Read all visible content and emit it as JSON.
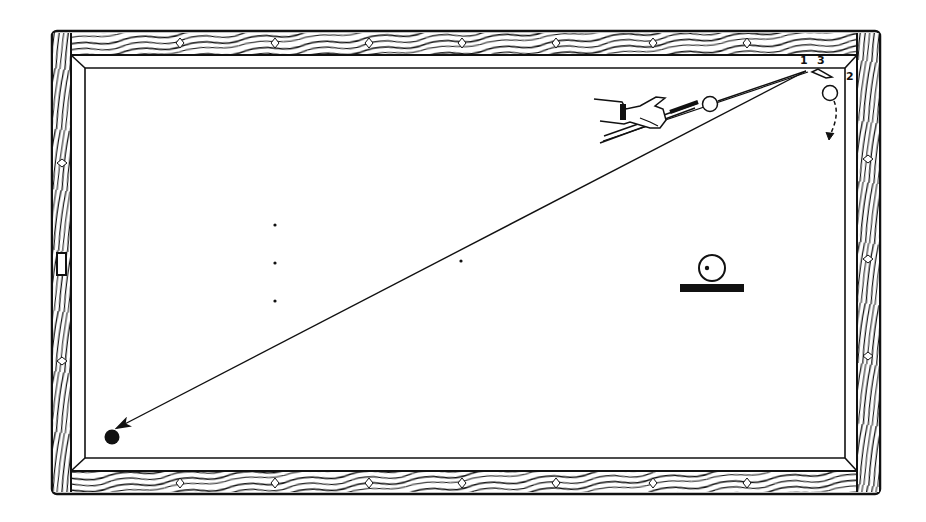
{
  "diagram": {
    "type": "billiard-table-shot-diagram",
    "labels": {
      "contact_1": "1",
      "contact_3": "3",
      "contact_2": "2"
    },
    "colors": {
      "ink": "#111111",
      "background": "#ffffff"
    },
    "elements": [
      "wooden-rails-with-diamonds",
      "cushions",
      "cue-and-hand",
      "cue-ball",
      "object-ball-near-corner",
      "shot-path-to-far-corner",
      "target-black-ball",
      "spot-dots",
      "ball-on-line-inset"
    ]
  }
}
